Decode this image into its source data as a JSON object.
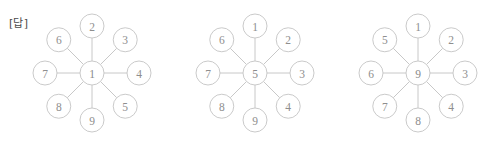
{
  "label": {
    "text": "[답]"
  },
  "colors": {
    "background": "#ffffff",
    "circle_stroke": "#c4c4c4",
    "spoke_stroke": "#c2c2c2",
    "number_text": "#8e8e8e",
    "label_text": "#4a4a4a"
  },
  "geometry": {
    "node_radius": 12,
    "spoke_length": 47,
    "centers_x": [
      92,
      255,
      418
    ],
    "center_y": 73
  },
  "diagrams": [
    {
      "name": "wheel-1",
      "center": "1",
      "outer": [
        {
          "position": "top",
          "value": "2"
        },
        {
          "position": "top-right",
          "value": "3"
        },
        {
          "position": "right",
          "value": "4"
        },
        {
          "position": "bottom-right",
          "value": "5"
        },
        {
          "position": "bottom",
          "value": "9"
        },
        {
          "position": "bottom-left",
          "value": "8"
        },
        {
          "position": "left",
          "value": "7"
        },
        {
          "position": "top-left",
          "value": "6"
        }
      ]
    },
    {
      "name": "wheel-2",
      "center": "5",
      "outer": [
        {
          "position": "top",
          "value": "1"
        },
        {
          "position": "top-right",
          "value": "2"
        },
        {
          "position": "right",
          "value": "3"
        },
        {
          "position": "bottom-right",
          "value": "4"
        },
        {
          "position": "bottom",
          "value": "9"
        },
        {
          "position": "bottom-left",
          "value": "8"
        },
        {
          "position": "left",
          "value": "7"
        },
        {
          "position": "top-left",
          "value": "6"
        }
      ]
    },
    {
      "name": "wheel-3",
      "center": "9",
      "outer": [
        {
          "position": "top",
          "value": "1"
        },
        {
          "position": "top-right",
          "value": "2"
        },
        {
          "position": "right",
          "value": "3"
        },
        {
          "position": "bottom-right",
          "value": "4"
        },
        {
          "position": "bottom",
          "value": "8"
        },
        {
          "position": "bottom-left",
          "value": "7"
        },
        {
          "position": "left",
          "value": "6"
        },
        {
          "position": "top-left",
          "value": "5"
        }
      ]
    }
  ]
}
